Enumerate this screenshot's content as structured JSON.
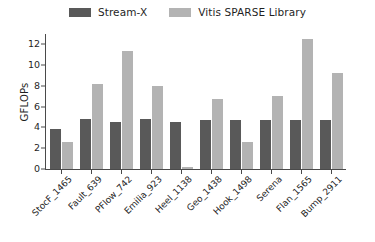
{
  "chart_data": {
    "type": "bar",
    "title": "",
    "xlabel": "",
    "ylabel": "GFLOPs",
    "ylim": [
      0,
      13
    ],
    "yticks": [
      0,
      2,
      4,
      6,
      8,
      10,
      12
    ],
    "grid": false,
    "legend_position": "top-center",
    "categories": [
      "StocF_1465",
      "Fault_639",
      "PFlow_742",
      "Emilia_923",
      "Heel_1138",
      "Geo_1438",
      "Hook_1498",
      "Serena",
      "Flan_1565",
      "Bump_2911"
    ],
    "series": [
      {
        "name": "Stream-X",
        "color": "#595959",
        "values": [
          3.9,
          4.8,
          4.5,
          4.8,
          4.5,
          4.7,
          4.7,
          4.7,
          4.7,
          4.7
        ]
      },
      {
        "name": "Vitis SPARSE Library",
        "color": "#b3b3b3",
        "values": [
          2.6,
          8.2,
          11.4,
          8.0,
          0.2,
          6.7,
          2.6,
          7.0,
          12.5,
          9.2
        ]
      }
    ]
  },
  "axis": {
    "y_label": "GFLOPs",
    "y_tick_labels": [
      "0",
      "2",
      "4",
      "6",
      "8",
      "10",
      "12"
    ]
  },
  "legend": {
    "items": [
      {
        "label": "Stream-X",
        "color": "#595959"
      },
      {
        "label": "Vitis SPARSE Library",
        "color": "#b3b3b3"
      }
    ]
  }
}
